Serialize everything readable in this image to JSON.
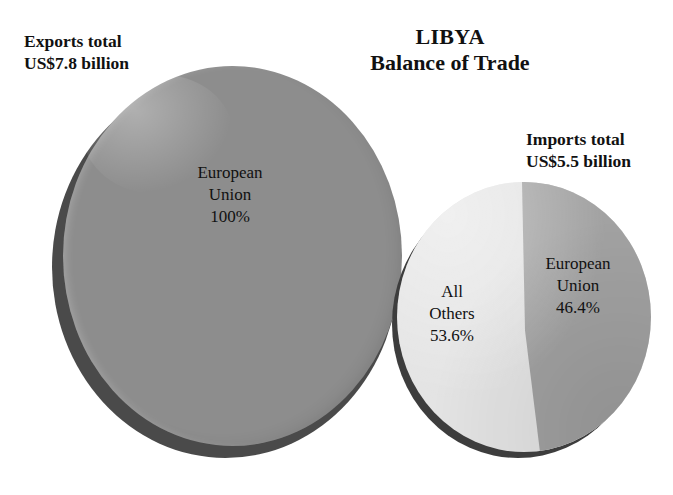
{
  "title": {
    "line1": "LIBYA",
    "line2": "Balance of Trade"
  },
  "labels": {
    "exports_line1": "Exports total",
    "exports_line2": "US$7.8 billion",
    "imports_line1": "Imports total",
    "imports_line2": "US$5.5 billion"
  },
  "pies": {
    "exports": {
      "slice_label_line1": "European",
      "slice_label_line2": "Union",
      "slice_label_value": "100%"
    },
    "imports": {
      "others_line1": "All",
      "others_line2": "Others",
      "others_value": "53.6%",
      "eu_line1": "European",
      "eu_line2": "Union",
      "eu_value": "46.4%"
    }
  },
  "colors": {
    "background": "#ffffff",
    "exports_face": "#8d8d8d",
    "exports_rim": "#4a4a4a",
    "imports_eu": "#a2a2a2",
    "imports_others": "#e4e4e4",
    "imports_rim": "#3d3d3d",
    "text": "#111111"
  },
  "chart_data": {
    "type": "pie",
    "title": "LIBYA Balance of Trade",
    "xlabel": "",
    "ylabel": "",
    "grid": false,
    "legend_position": "none",
    "charts": [
      {
        "name": "Exports",
        "annotation": "Exports total US$7.8 billion",
        "total_value": 7.8,
        "total_units": "US$ billion",
        "slices": [
          {
            "label": "European Union",
            "value": 100.0,
            "display": "100%",
            "color": "#8d8d8d"
          }
        ]
      },
      {
        "name": "Imports",
        "annotation": "Imports total US$5.5 billion",
        "total_value": 5.5,
        "total_units": "US$ billion",
        "slices": [
          {
            "label": "All Others",
            "value": 53.6,
            "display": "53.6%",
            "color": "#e4e4e4"
          },
          {
            "label": "European Union",
            "value": 46.4,
            "display": "46.4%",
            "color": "#a2a2a2"
          }
        ]
      }
    ]
  }
}
